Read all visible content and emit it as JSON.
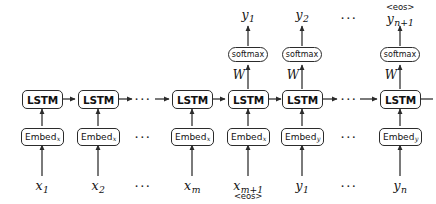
{
  "figure": {
    "kind": "sequence-to-sequence LSTM encoder-decoder unrolled diagram",
    "ellipsis": "···"
  },
  "recurrent_row": {
    "cell_label": "LSTM",
    "cells": [
      {
        "id": "lstm-1",
        "label": "LSTM"
      },
      {
        "id": "lstm-2",
        "label": "LSTM"
      },
      {
        "id": "lstm-3",
        "label": "LSTM"
      },
      {
        "id": "lstm-4",
        "label": "LSTM"
      },
      {
        "id": "lstm-5",
        "label": "LSTM"
      },
      {
        "id": "lstm-6",
        "label": "LSTM"
      }
    ]
  },
  "embedding_row": {
    "cells": [
      {
        "id": "embed-1",
        "label": "Embed",
        "subscript": "x"
      },
      {
        "id": "embed-2",
        "label": "Embed",
        "subscript": "x"
      },
      {
        "id": "embed-3",
        "label": "Embed",
        "subscript": "x"
      },
      {
        "id": "embed-4",
        "label": "Embed",
        "subscript": "x"
      },
      {
        "id": "embed-5",
        "label": "Embed",
        "subscript": "y"
      },
      {
        "id": "embed-6",
        "label": "Embed",
        "subscript": "y"
      }
    ]
  },
  "output_row": {
    "softmax_label": "softmax",
    "projection_label": "W",
    "cells": [
      {
        "id": "softmax-1",
        "label": "softmax",
        "weight": "W"
      },
      {
        "id": "softmax-2",
        "label": "softmax",
        "weight": "W"
      },
      {
        "id": "softmax-3",
        "label": "softmax",
        "weight": "W"
      }
    ]
  },
  "inputs": [
    {
      "id": "input-x1",
      "symbol": "x",
      "index": "1",
      "extra": ""
    },
    {
      "id": "input-x2",
      "symbol": "x",
      "index": "2",
      "extra": ""
    },
    {
      "id": "input-xm",
      "symbol": "x",
      "index": "m",
      "extra": ""
    },
    {
      "id": "input-xm1",
      "symbol": "x",
      "index": "m+1",
      "extra": "<eos>"
    },
    {
      "id": "input-y1",
      "symbol": "y",
      "index": "1",
      "extra": ""
    },
    {
      "id": "input-yn",
      "symbol": "y",
      "index": "n",
      "extra": ""
    }
  ],
  "outputs": [
    {
      "id": "output-y1",
      "symbol": "y",
      "index": "1",
      "extra": ""
    },
    {
      "id": "output-y2",
      "symbol": "y",
      "index": "2",
      "extra": ""
    },
    {
      "id": "output-yn1",
      "symbol": "y",
      "index": "n+1",
      "extra": "<eos>"
    }
  ],
  "colors": {
    "stroke": "#2b2b2b",
    "text": "#121212",
    "background": "#ffffff"
  }
}
